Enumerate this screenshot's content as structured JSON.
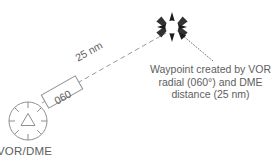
{
  "diagram": {
    "title_hidden": "",
    "background_color": "#ffffff",
    "line_color": "#8a8a8a",
    "text_color": "#5e5e5e",
    "symbol_color": "#1a1a1a",
    "station": {
      "icon_name": "vor-dme-station-icon",
      "label": "VOR/DME",
      "center_x": 28,
      "center_y": 121,
      "radius": 19
    },
    "waypoint": {
      "icon_name": "waypoint-star-icon",
      "center_x": 172,
      "center_y": 27,
      "outer_radius": 15,
      "inner_circle_radius": 6.5
    },
    "radial": {
      "label": "060",
      "boxed": true,
      "angle_deg": -29.5
    },
    "distance": {
      "label": "25 nm",
      "angle_deg": -29.5
    },
    "callout": {
      "line1": "Waypoint created by VOR",
      "line2": "radial (060°) and DME",
      "line3": "distance (25 nm)",
      "full_text": "Waypoint created by VOR radial (060°) and DME distance (25 nm)"
    }
  }
}
